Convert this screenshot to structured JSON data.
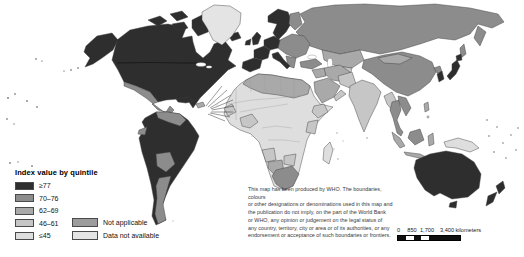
{
  "legend": {
    "title": "Index value by quintile",
    "items": [
      {
        "label": "≥77"
      },
      {
        "label": "70–76"
      },
      {
        "label": "62–69"
      },
      {
        "label": "46–61"
      },
      {
        "label": "≤45"
      }
    ],
    "extra_items": [
      {
        "label": "Not applicable"
      },
      {
        "label": "Data not available"
      }
    ]
  },
  "map": {
    "colors": {
      "q1": "#2e2e2e",
      "q2": "#8c8c8c",
      "q3": "#a9a9a9",
      "q4": "#c6c6c6",
      "q5": "#dedede",
      "not_applicable": "#9c9c9c",
      "no_data": "#e4e4e4",
      "border": "#3f3f3f",
      "ocean": "#ffffff"
    }
  },
  "disclaimer": {
    "lines": [
      "This map has been produced by WHO. The boundaries, colours",
      "or other designations or denominations used in this map and",
      "the publication do not imply, on the part of the World Bank",
      "or WHO, any opinion or judgement on the legal status of",
      "any country, territory, city or area or of its authorities, or any",
      "endorsement or acceptance of such boundaries or frontiers."
    ]
  },
  "scale_bar": {
    "tick_0": "0",
    "tick_850": "850",
    "tick_1700": "1,700",
    "end_label": "3,400 kilometers"
  }
}
